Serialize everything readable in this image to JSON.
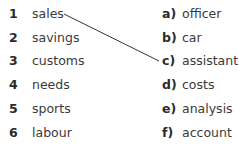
{
  "exercise": {
    "left_items": [
      {
        "number": "1",
        "word": "sales"
      },
      {
        "number": "2",
        "word": "savings"
      },
      {
        "number": "3",
        "word": "customs"
      },
      {
        "number": "4",
        "word": "needs"
      },
      {
        "number": "5",
        "word": "sports"
      },
      {
        "number": "6",
        "word": "labour"
      }
    ],
    "right_items": [
      {
        "letter": "a)",
        "word": "officer"
      },
      {
        "letter": "b)",
        "word": "car"
      },
      {
        "letter": "c)",
        "word": "assistant"
      },
      {
        "letter": "d)",
        "word": "costs"
      },
      {
        "letter": "e)",
        "word": "analysis"
      },
      {
        "letter": "f)",
        "word": "account"
      }
    ],
    "example_match": {
      "from": "1",
      "to": "c)"
    }
  }
}
